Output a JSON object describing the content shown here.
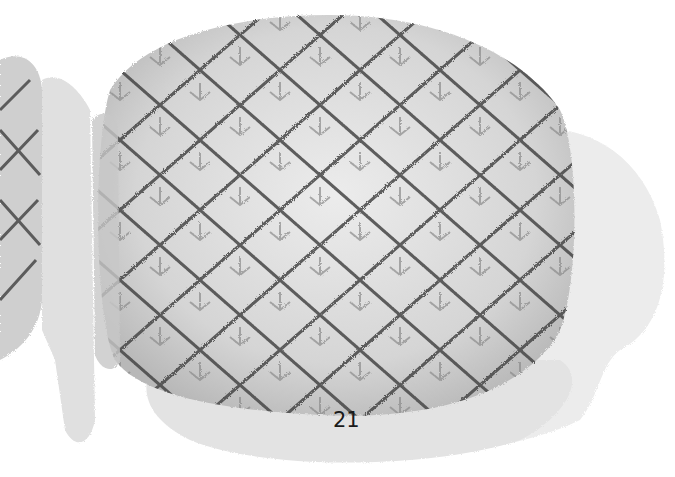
{
  "illustration": {
    "subject": "pineapple slices watercolor",
    "style": "grayscale watercolor",
    "colors": {
      "background": "#ffffff",
      "wash_light": "#e6e6e6",
      "wash_mid": "#cfcfcf",
      "body": "#d9d9d9",
      "outline_dark": "#3a3a3a",
      "outline_mid": "#6e6e6e"
    }
  },
  "page": {
    "number": "21"
  }
}
